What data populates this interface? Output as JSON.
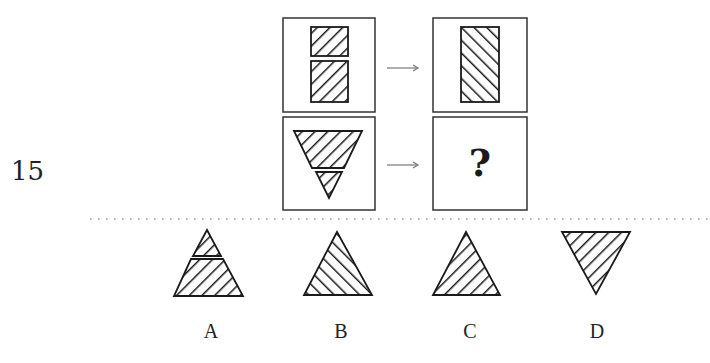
{
  "question": {
    "number": "15",
    "unknown_symbol": "?",
    "rows": [
      {
        "left": {
          "shape": "two-stacked-rectangles",
          "hatch": "forward-slash"
        },
        "arrow": "right-arrow-icon",
        "right": {
          "shape": "single-tall-rectangle",
          "hatch": "back-slash"
        }
      },
      {
        "left": {
          "shape": "inverted-triangle-split",
          "hatch": "forward-slash"
        },
        "arrow": "right-arrow-icon",
        "right": {
          "shape": "unknown",
          "label": "?"
        }
      }
    ]
  },
  "options": [
    {
      "label": "A",
      "shape": "upright-triangle-split",
      "hatch": "forward-slash"
    },
    {
      "label": "B",
      "shape": "upright-triangle",
      "hatch": "back-slash"
    },
    {
      "label": "C",
      "shape": "upright-triangle",
      "hatch": "forward-slash"
    },
    {
      "label": "D",
      "shape": "inverted-triangle",
      "hatch": "forward-slash"
    }
  ],
  "colors": {
    "stroke": "#1a1a1a",
    "box_border": "#333333",
    "divider": "#999999",
    "background": "#ffffff"
  }
}
